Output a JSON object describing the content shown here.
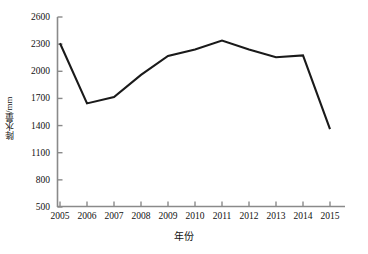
{
  "chart_data": {
    "type": "line",
    "title": "",
    "xlabel": "年份",
    "ylabel": "降水量/mm",
    "categories": [
      "2005",
      "2006",
      "2007",
      "2008",
      "2009",
      "2010",
      "2011",
      "2012",
      "2013",
      "2014",
      "2015"
    ],
    "x": [
      2005,
      2006,
      2007,
      2008,
      2009,
      2010,
      2011,
      2012,
      2013,
      2014,
      2015
    ],
    "values": [
      2310,
      1645,
      1715,
      1960,
      2170,
      2240,
      2340,
      2240,
      2155,
      2175,
      1360
    ],
    "series": [
      {
        "name": "降水量",
        "values": [
          2310,
          1645,
          1715,
          1960,
          2170,
          2240,
          2340,
          2240,
          2155,
          2175,
          1360
        ]
      }
    ],
    "ylim": [
      500,
      2600
    ],
    "ytick_values": [
      500,
      800,
      1100,
      1400,
      1700,
      2000,
      2300,
      2600
    ],
    "ytick_labels": [
      "500",
      "800",
      "1100",
      "1400",
      "1700",
      "2000",
      "2300",
      "2600"
    ],
    "xtick_labels": [
      "2005",
      "2006",
      "2007",
      "2008",
      "2009",
      "2010",
      "2011",
      "2012",
      "2013",
      "2014",
      "2015"
    ],
    "grid": false,
    "legend": false,
    "legend_position": "none",
    "line_color": "#1a1a1a",
    "axis_color": "#8a8a8a",
    "background_color": "#ffffff",
    "markers": false
  },
  "axes": {
    "y_title": "降水量/mm",
    "x_title": "年份",
    "y_labels": {
      "t0": "2600",
      "t1": "2300",
      "t2": "2000",
      "t3": "1700",
      "t4": "1400",
      "t5": "1100",
      "t6": "800",
      "t7": "500"
    },
    "x_labels": {
      "t0": "2005",
      "t1": "2006",
      "t2": "2007",
      "t3": "2008",
      "t4": "2009",
      "t5": "2010",
      "t6": "2011",
      "t7": "2012",
      "t8": "2013",
      "t9": "2014",
      "t10": "2015"
    }
  }
}
